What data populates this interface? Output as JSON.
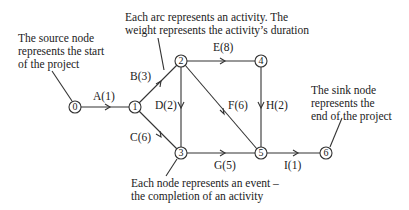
{
  "diagram": {
    "type": "activity-on-arc network",
    "nodes": [
      {
        "id": "0",
        "label": "0",
        "x": 75,
        "y": 107
      },
      {
        "id": "1",
        "label": "1",
        "x": 135,
        "y": 107
      },
      {
        "id": "2",
        "label": "2",
        "x": 181,
        "y": 61
      },
      {
        "id": "3",
        "label": "3",
        "x": 181,
        "y": 153
      },
      {
        "id": "4",
        "label": "4",
        "x": 261,
        "y": 61
      },
      {
        "id": "5",
        "label": "5",
        "x": 261,
        "y": 153
      },
      {
        "id": "6",
        "label": "6",
        "x": 326,
        "y": 153
      }
    ],
    "arcs": [
      {
        "from": "0",
        "to": "1",
        "label": "A(1)",
        "activity": "A",
        "duration": 1
      },
      {
        "from": "1",
        "to": "2",
        "label": "B(3)",
        "activity": "B",
        "duration": 3
      },
      {
        "from": "1",
        "to": "3",
        "label": "C(6)",
        "activity": "C",
        "duration": 6
      },
      {
        "from": "2",
        "to": "3",
        "label": "D(2)",
        "activity": "D",
        "duration": 2
      },
      {
        "from": "2",
        "to": "4",
        "label": "E(8)",
        "activity": "E",
        "duration": 8
      },
      {
        "from": "2",
        "to": "5",
        "label": "F(6)",
        "activity": "F",
        "duration": 6
      },
      {
        "from": "3",
        "to": "5",
        "label": "G(5)",
        "activity": "G",
        "duration": 5
      },
      {
        "from": "4",
        "to": "5",
        "label": "H(2)",
        "activity": "H",
        "duration": 2
      },
      {
        "from": "5",
        "to": "6",
        "label": "I(1)",
        "activity": "I",
        "duration": 1
      }
    ],
    "annotations": {
      "source": [
        "The source node",
        "represents the start",
        "of the project"
      ],
      "arc": [
        "Each arc represents an activity. The",
        "weight represents the activity’s duration"
      ],
      "sink": [
        "The sink node",
        "represents the",
        "end of the project"
      ],
      "event": [
        "Each node represents an event –",
        "the completion of an activity"
      ]
    }
  }
}
